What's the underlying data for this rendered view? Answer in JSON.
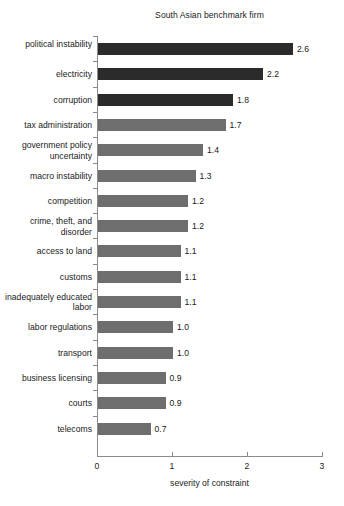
{
  "chart_data": {
    "type": "bar",
    "orientation": "horizontal",
    "title": "South Asian benchmark firm",
    "xlabel": "severity of constraint",
    "ylabel": "",
    "xlim": [
      0,
      3
    ],
    "xticks": [
      "0",
      "1",
      "2",
      "3"
    ],
    "xtick_values": [
      0,
      1,
      2,
      3
    ],
    "grid": false,
    "legend": null,
    "categories": [
      "political instability",
      "electricity",
      "corruption",
      "tax administration",
      "government policy uncertainty",
      "macro instability",
      "competition",
      "crime, theft, and disorder",
      "access to land",
      "customs",
      "inadequately educated labor",
      "labor regulations",
      "transport",
      "business licensing",
      "courts",
      "telecoms"
    ],
    "values": [
      2.6,
      2.2,
      1.8,
      1.7,
      1.4,
      1.3,
      1.2,
      1.2,
      1.1,
      1.1,
      1.1,
      1.0,
      1.0,
      0.9,
      0.9,
      0.7
    ],
    "value_labels": [
      "2.6",
      "2.2",
      "1.8",
      "1.7",
      "1.4",
      "1.3",
      "1.2",
      "1.2",
      "1.1",
      "1.1",
      "1.1",
      "1.0",
      "1.0",
      "0.9",
      "0.9",
      "0.7"
    ],
    "bar_colors": [
      "#2b2b2b",
      "#2b2b2b",
      "#2b2b2b",
      "#6e6e6e",
      "#6e6e6e",
      "#6e6e6e",
      "#6e6e6e",
      "#6e6e6e",
      "#6e6e6e",
      "#6e6e6e",
      "#6e6e6e",
      "#6e6e6e",
      "#6e6e6e",
      "#6e6e6e",
      "#6e6e6e",
      "#6e6e6e"
    ],
    "colors": {
      "dark_bar": "#2b2b2b",
      "light_bar": "#6e6e6e",
      "axis": "#8a8a8a",
      "text": "#1a1a1a",
      "background": "#ffffff"
    }
  }
}
